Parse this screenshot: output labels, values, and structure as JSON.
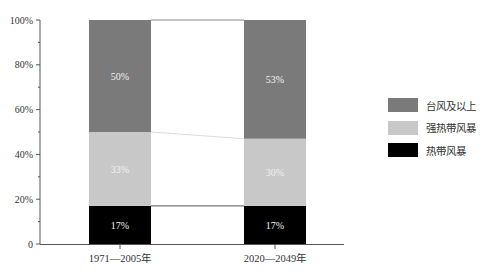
{
  "chart_data": {
    "type": "bar",
    "stacked": true,
    "title": "",
    "xlabel": "",
    "ylabel": "",
    "ylim": [
      0,
      100
    ],
    "yticks": [
      "0",
      "20%",
      "40%",
      "60%",
      "80%",
      "100%"
    ],
    "categories": [
      "1971—2005年",
      "2020—2049年"
    ],
    "series": [
      {
        "name": "热带风暴",
        "color": "#000000",
        "values": [
          17,
          17
        ],
        "labels": [
          "17%",
          "17%"
        ]
      },
      {
        "name": "强热带风暴",
        "color": "#c8c8c8",
        "values": [
          33,
          30
        ],
        "labels": [
          "33%",
          "30%"
        ]
      },
      {
        "name": "台风及以上",
        "color": "#7a7a7a",
        "values": [
          50,
          53
        ],
        "labels": [
          "50%",
          "53%"
        ]
      }
    ],
    "legend_position": "right",
    "grid": false,
    "connector_lines": true
  },
  "legend": {
    "items": [
      {
        "label": "台风及以上",
        "color": "#7a7a7a"
      },
      {
        "label": "强热带风暴",
        "color": "#c8c8c8"
      },
      {
        "label": "热带风暴",
        "color": "#000000"
      }
    ]
  }
}
